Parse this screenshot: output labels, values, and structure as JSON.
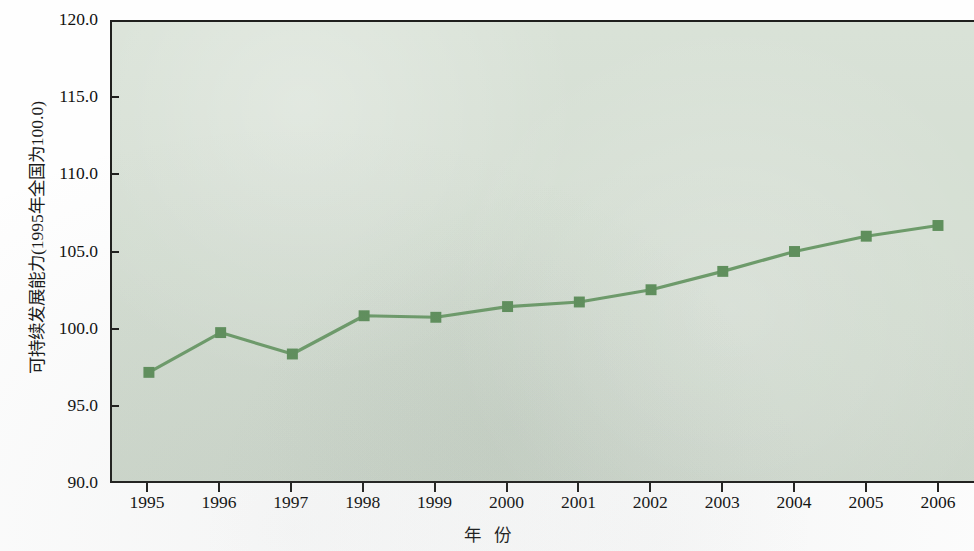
{
  "chart_data": {
    "type": "line",
    "title": "",
    "xlabel": "年  份",
    "ylabel": "可持续发展能力(1995年全国为100.0)",
    "categories": [
      "1995",
      "1996",
      "1997",
      "1998",
      "1999",
      "2000",
      "2001",
      "2002",
      "2003",
      "2004",
      "2005",
      "2006"
    ],
    "values": [
      97.1,
      99.7,
      98.3,
      100.8,
      100.7,
      101.4,
      101.7,
      102.5,
      103.7,
      105.0,
      106.0,
      106.7
    ],
    "series": [
      {
        "name": "可持续发展能力",
        "values": [
          97.1,
          99.7,
          98.3,
          100.8,
          100.7,
          101.4,
          101.7,
          102.5,
          103.7,
          105.0,
          106.0,
          106.7
        ]
      }
    ],
    "ylim": [
      90.0,
      120.0
    ],
    "ytick_labels": [
      "120.0",
      "115.0",
      "110.0",
      "105.0",
      "100.0",
      "95.0",
      "90.0"
    ],
    "ytick_values": [
      120.0,
      115.0,
      110.0,
      105.0,
      100.0,
      95.0,
      90.0
    ],
    "xtick_labels": [
      "1995",
      "1996",
      "1997",
      "1998",
      "1999",
      "2000",
      "2001",
      "2002",
      "2003",
      "2004",
      "2005",
      "2006"
    ],
    "grid": false,
    "legend": "none",
    "marker": "square",
    "colors": {
      "line": "#6d9b6a",
      "marker": "#5f8f5c",
      "plot_background": "#d6e0d4",
      "axis": "#20201e",
      "text": "#111111"
    }
  }
}
